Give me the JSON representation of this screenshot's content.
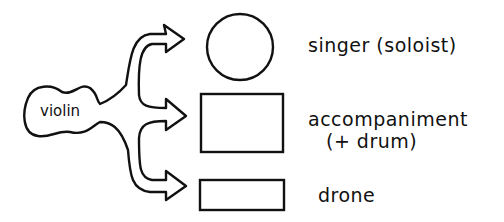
{
  "diagram": {
    "source": {
      "label": "violin"
    },
    "targets": [
      {
        "shape": "circle",
        "label": "singer (soloist)",
        "sublabel": ""
      },
      {
        "shape": "rectangle-large",
        "label": "accompaniment",
        "sublabel": "(+ drum)"
      },
      {
        "shape": "rectangle-small",
        "label": "drone",
        "sublabel": ""
      }
    ],
    "stroke_color": "#111111",
    "background": "#ffffff"
  }
}
